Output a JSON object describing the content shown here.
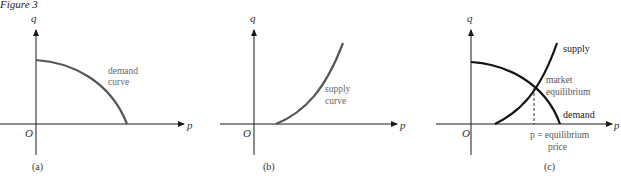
{
  "figure_title": "Figure 3",
  "panels": [
    {
      "id": "a",
      "caption": "(a)",
      "axis_y_label": "q",
      "axis_x_label": "p",
      "origin_label": "O",
      "curve_label_line1": "demand",
      "curve_label_line2": "curve"
    },
    {
      "id": "b",
      "caption": "(b)",
      "axis_y_label": "q",
      "axis_x_label": "p",
      "origin_label": "O",
      "curve_label_line1": "supply",
      "curve_label_line2": "curve"
    },
    {
      "id": "c",
      "caption": "(c)",
      "axis_y_label": "q",
      "axis_x_label": "p",
      "origin_label": "O",
      "supply_label": "supply",
      "demand_label": "demand",
      "equilibrium_label_line1": "market",
      "equilibrium_label_line2": "equilibrium",
      "price_label_line1": "p = equilibrium",
      "price_label_line2": "price"
    }
  ],
  "colors": {
    "axis": "#1a1a1a",
    "curve_ab": "#555555",
    "curve_c": "#111111",
    "label": "#444444"
  }
}
